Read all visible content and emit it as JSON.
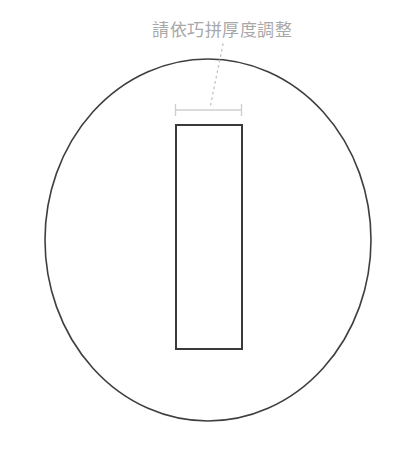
{
  "canvas": {
    "width": 404,
    "height": 464,
    "background_color": "#ffffff"
  },
  "annotation": {
    "label": "請依巧拼厚度調整",
    "color": "#a8a8a8",
    "font_size_px": 17,
    "x": 152,
    "y": 19
  },
  "leader_line": {
    "name": "dotted-leader-line",
    "style": "dotted",
    "color": "#c0c0c0",
    "from_x": 223,
    "from_y": 44,
    "to_x": 210,
    "to_y": 108
  },
  "dimension_line": {
    "name": "width-dimension-line",
    "color": "#cfcfcf",
    "y": 110,
    "x_start": 175,
    "x_end": 242,
    "tick_height": 12,
    "value_label": ""
  },
  "shapes": {
    "circle": {
      "name": "outer-circle",
      "center_x": 208,
      "center_y": 240,
      "radius_x": 163,
      "radius_y": 181,
      "stroke_color": "#3f3f3f",
      "stroke_width": 1.6,
      "fill": "none"
    },
    "rectangle": {
      "name": "inner-rectangle",
      "x": 175,
      "y": 124,
      "width": 68,
      "height": 226,
      "stroke_color": "#3a3a3a",
      "stroke_width": 2,
      "fill": "none"
    }
  }
}
